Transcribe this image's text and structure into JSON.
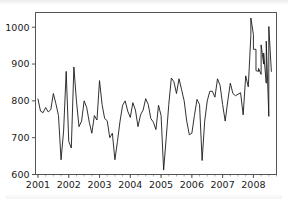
{
  "figure": {
    "name": "monthly-time-series-line-chart",
    "background_color": "#ffffff",
    "line_color": "#1a1a1a",
    "axis_color": "#555555"
  },
  "chart_data": {
    "type": "line",
    "title": "",
    "subtitle": "",
    "xlabel": "",
    "ylabel": "",
    "xlim": [
      2000.92,
      2008.75
    ],
    "ylim": [
      600,
      1040
    ],
    "grid": false,
    "legend": null,
    "series_name": "",
    "y_ticks": [
      600,
      700,
      800,
      900,
      1000
    ],
    "y_tick_labels": [
      "600",
      "700",
      "800",
      "900",
      "1000"
    ],
    "x_ticks": [
      2001,
      2002,
      2003,
      2004,
      2005,
      2006,
      2007,
      2008
    ],
    "x_tick_labels": [
      "2001",
      "2002",
      "2003",
      "2004",
      "2005",
      "2006",
      "2007",
      "2008"
    ],
    "x_minor_tick_interval": 0.25,
    "x": [
      2001.0,
      2001.083,
      2001.167,
      2001.25,
      2001.333,
      2001.417,
      2001.5,
      2001.583,
      2001.667,
      2001.75,
      2001.833,
      2001.917,
      2002.0,
      2002.083,
      2002.167,
      2002.25,
      2002.333,
      2002.417,
      2002.5,
      2002.583,
      2002.667,
      2002.75,
      2002.833,
      2002.917,
      2003.0,
      2003.083,
      2003.167,
      2003.25,
      2003.333,
      2003.417,
      2003.5,
      2003.583,
      2003.667,
      2003.75,
      2003.833,
      2003.917,
      2004.0,
      2004.083,
      2004.167,
      2004.25,
      2004.333,
      2004.417,
      2004.5,
      2004.583,
      2004.667,
      2004.75,
      2004.833,
      2004.917,
      2005.0,
      2005.083,
      2005.167,
      2005.25,
      2005.333,
      2005.417,
      2005.5,
      2005.583,
      2005.667,
      2005.75,
      2005.833,
      2005.917,
      2006.0,
      2006.083,
      2006.167,
      2006.25,
      2006.333,
      2006.417,
      2006.5,
      2006.583,
      2006.667,
      2006.75,
      2006.833,
      2006.917,
      2007.0,
      2007.083,
      2007.167,
      2007.25,
      2007.333,
      2007.417,
      2007.5,
      2007.583,
      2007.667,
      2007.75,
      2007.833,
      2007.917,
      2008.0,
      2008.083,
      2008.167,
      2008.25,
      2008.333,
      2008.417,
      2008.5,
      2008.583
    ],
    "values": [
      805,
      772,
      768,
      782,
      770,
      776,
      820,
      792,
      760,
      640,
      718,
      880,
      690,
      672,
      892,
      800,
      730,
      745,
      800,
      782,
      742,
      712,
      760,
      748,
      855,
      790,
      752,
      746,
      700,
      712,
      640,
      690,
      745,
      788,
      800,
      772,
      755,
      795,
      775,
      730,
      762,
      775,
      806,
      790,
      752,
      742,
      722,
      788,
      760,
      612,
      700,
      790,
      862,
      852,
      820,
      860,
      830,
      800,
      745,
      708,
      712,
      760,
      804,
      790,
      638,
      745,
      800,
      826,
      826,
      810,
      860,
      842,
      790,
      745,
      800,
      848,
      820,
      814,
      818,
      822,
      762,
      868,
      838,
      978,
      980,
      940,
      880,
      872,
      900,
      848,
      758,
      880
    ],
    "annotations": [
      {
        "label": "series_min",
        "x": 2005.083,
        "y": 612
      },
      {
        "label": "series_max",
        "x": 2007.917,
        "y": 1025
      }
    ],
    "values_tail": [
      1025,
      940,
      882,
      888,
      952,
      930,
      962,
      1002
    ],
    "x_tail": [
      2007.917,
      2008.0,
      2008.083,
      2008.167,
      2008.25,
      2008.333,
      2008.417,
      2008.5
    ]
  }
}
